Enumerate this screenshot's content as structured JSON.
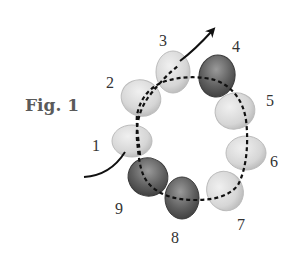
{
  "figure": {
    "label": "Fig. 1",
    "colors": {
      "light_bead": "#d9d9d9",
      "light_bead_edge": "#b5b5b5",
      "dark_bead": "#5c5c5c",
      "dark_bead_edge": "#3a3a3a",
      "thread": "#111111"
    },
    "beads": [
      {
        "number": "1",
        "shade": "light"
      },
      {
        "number": "2",
        "shade": "light"
      },
      {
        "number": "3",
        "shade": "light"
      },
      {
        "number": "4",
        "shade": "dark"
      },
      {
        "number": "5",
        "shade": "light"
      },
      {
        "number": "6",
        "shade": "light"
      },
      {
        "number": "7",
        "shade": "light"
      },
      {
        "number": "8",
        "shade": "dark"
      },
      {
        "number": "9",
        "shade": "dark"
      }
    ]
  }
}
